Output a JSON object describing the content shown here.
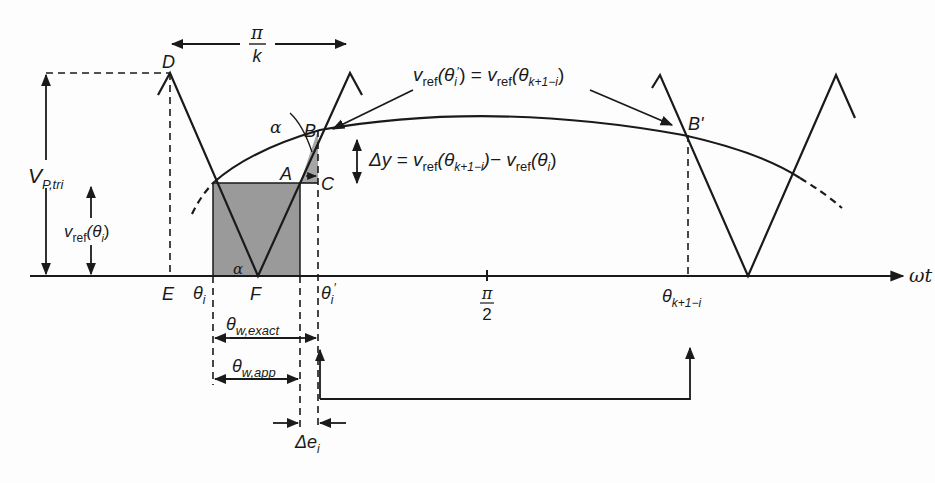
{
  "figure": {
    "kind": "PWM switching-angle approximation diagram",
    "colors": {
      "line": "#1a1a1a",
      "shade": "#9a9a9a",
      "background": "#fdfdfd"
    }
  },
  "labels": {
    "period_top": {
      "num": "π",
      "den": "k"
    },
    "point_D": "D",
    "point_E": "E",
    "point_F": "F",
    "point_A": "A",
    "point_B": "B",
    "point_C": "C",
    "point_B_prime": "B'",
    "alpha_upper": "α",
    "alpha_lower": "α",
    "vp_tri": {
      "main": "V",
      "sub": "P,tri"
    },
    "vref_theta_i": {
      "main": "v",
      "sub": "ref",
      "arg": "(θ",
      "arg_sub": "i",
      "close": ")"
    },
    "equality": {
      "lhs_main": "v",
      "lhs_sub": "ref",
      "lhs_arg": "(θ",
      "lhs_arg_sub": "i",
      "lhs_prime": "′",
      "lhs_close": ")",
      "eq": " = ",
      "rhs_main": "v",
      "rhs_sub": "ref",
      "rhs_arg": "(θ",
      "rhs_arg_sub": "k+1−i",
      "rhs_close": ")"
    },
    "delta_y": {
      "lead": "Δy = v",
      "s1": "ref",
      "a1": "(θ",
      "a1_sub": "k+1−i",
      "mid": ")− v",
      "s2": "ref",
      "a2": "(θ",
      "a2_sub": "i",
      "close": ")"
    },
    "axis": {
      "wt": "ωt",
      "theta_i": {
        "main": "θ",
        "sub": "i"
      },
      "theta_i_prime": {
        "main": "θ",
        "sub": "i",
        "prime": "′"
      },
      "pi_half": {
        "num": "π",
        "den": "2"
      },
      "theta_k1i": {
        "main": "θ",
        "sub": "k+1−i"
      }
    },
    "theta_w_exact": {
      "main": "θ",
      "sub": "w,exact"
    },
    "theta_w_app": {
      "main": "θ",
      "sub": "w,app"
    },
    "delta_e_i": {
      "main": "Δe",
      "sub": "i"
    }
  }
}
